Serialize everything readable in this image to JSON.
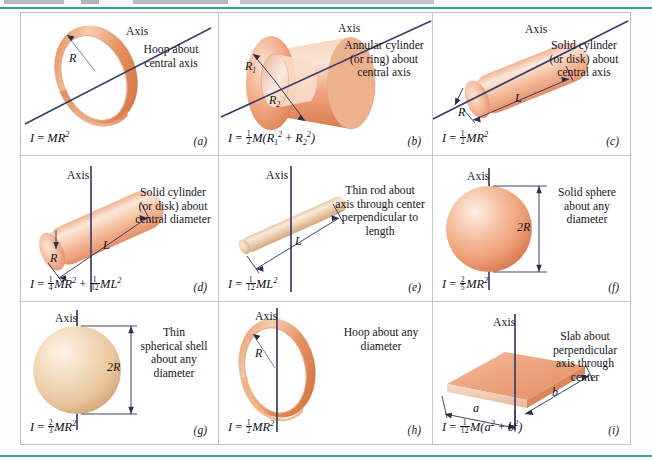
{
  "figure": {
    "header_caption_visible": false,
    "axis_word": "Axis",
    "rule_color": "#37a396",
    "frame_color": "#b9bfc4",
    "axis_color": "#3b3f6d"
  },
  "panels": [
    {
      "key": "a",
      "letter": "(a)",
      "axis_label": "Axis",
      "caption": "Hoop about\ncentral axis",
      "formula_plain": "I = MR²",
      "dimension_labels": [
        "R"
      ],
      "shape": "hoop-tilted",
      "body_color": "#e08a5f"
    },
    {
      "key": "b",
      "letter": "(b)",
      "axis_label": "Axis",
      "caption": "Annular cylinder\n(or ring) about\ncentral axis",
      "formula_plain": "I = ½M(R₁² + R₂²)",
      "dimension_labels": [
        "R₁",
        "R₂"
      ],
      "shape": "annular-cylinder",
      "body_color": "#f0a888"
    },
    {
      "key": "c",
      "letter": "(c)",
      "axis_label": "Axis",
      "caption": "Solid cylinder\n(or disk) about\ncentral axis",
      "formula_plain": "I = ½MR²",
      "dimension_labels": [
        "R",
        "L"
      ],
      "shape": "solid-cylinder-tilted",
      "body_color": "#f2b193"
    },
    {
      "key": "d",
      "letter": "(d)",
      "axis_label": "Axis",
      "caption": "Solid cylinder\n(or disk) about\ncentral diameter",
      "formula_plain": "I = ¼MR² + 1/12 ML²",
      "dimension_labels": [
        "R",
        "L"
      ],
      "shape": "solid-cylinder-vertical-axis",
      "body_color": "#f2b193"
    },
    {
      "key": "e",
      "letter": "(e)",
      "axis_label": "Axis",
      "caption": "Thin rod about\naxis through center\nperpendicular to\nlength",
      "formula_plain": "I = 1/12 ML²",
      "dimension_labels": [
        "L"
      ],
      "shape": "thin-rod",
      "body_color": "#e7c3a2"
    },
    {
      "key": "f",
      "letter": "(f)",
      "axis_label": "Axis",
      "caption": "Solid sphere\nabout any\ndiameter",
      "formula_plain": "I = 2/5 MR²",
      "dimension_labels": [
        "2R"
      ],
      "shape": "solid-sphere",
      "body_color": "#eea181"
    },
    {
      "key": "g",
      "letter": "(g)",
      "axis_label": "Axis",
      "caption": "Thin\nspherical shell\nabout any\ndiameter",
      "formula_plain": "I = 2/3 MR²",
      "dimension_labels": [
        "2R"
      ],
      "shape": "thin-spherical-shell",
      "body_color": "#eccaa6"
    },
    {
      "key": "h",
      "letter": "(h)",
      "axis_label": "Axis",
      "caption": "Hoop about any\ndiameter",
      "formula_plain": "I = ½MR²",
      "dimension_labels": [
        "R"
      ],
      "shape": "hoop-vertical-axis",
      "body_color": "#e08a5f"
    },
    {
      "key": "i",
      "letter": "(i)",
      "axis_label": "Axis",
      "caption": "Slab about\nperpendicular\naxis through\ncenter",
      "formula_plain": "I = 1/12 M(a² + b²)",
      "dimension_labels": [
        "a",
        "b"
      ],
      "shape": "slab",
      "body_color": "#e89270"
    }
  ]
}
